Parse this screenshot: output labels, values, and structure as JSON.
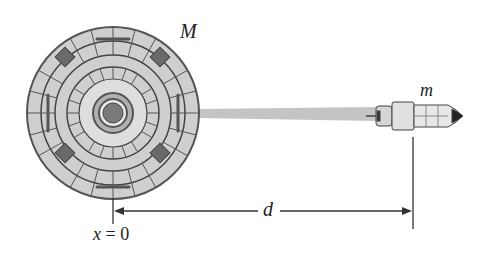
{
  "figure": {
    "labels": {
      "planet_mass": "M",
      "rocket_mass": "m",
      "distance": "d",
      "origin": "x = 0"
    },
    "objects": [
      {
        "name": "planet",
        "description": "space station / planet of mass M at x = 0"
      },
      {
        "name": "rocket",
        "description": "spacecraft of mass m at distance d"
      },
      {
        "name": "exhaust",
        "description": "rocket exhaust trail pointing back toward planet"
      }
    ],
    "colors": {
      "ink": "#333333",
      "fill_light": "#d9d9d9",
      "fill_mid": "#b5b5b5",
      "fill_dark": "#6f6f6f",
      "exhaust": "#bdbdbd"
    }
  }
}
